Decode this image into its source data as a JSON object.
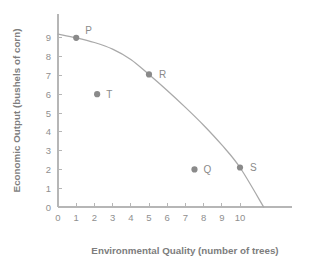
{
  "chart_data": {
    "type": "scatter",
    "title": "",
    "xlabel": "Environmental Quality (number of trees)",
    "ylabel": "Economic Output (bushels of corn)",
    "xlim": [
      0,
      11.6
    ],
    "ylim": [
      0,
      9.6
    ],
    "xticks": [
      "0",
      "1",
      "2",
      "3",
      "4",
      "5",
      "6",
      "7",
      "8",
      "9",
      "10"
    ],
    "yticks": [
      "0",
      "1",
      "2",
      "3",
      "4",
      "5",
      "6",
      "7",
      "8",
      "9"
    ],
    "grid": false,
    "legend": "none",
    "series": [
      {
        "name": "Production Possibilities Frontier",
        "type": "line",
        "x": [
          0,
          1,
          2,
          3,
          4,
          5,
          6,
          7,
          8,
          9,
          10,
          11.3
        ],
        "y": [
          9.2,
          9.0,
          8.75,
          8.4,
          7.85,
          7.05,
          6.2,
          5.3,
          4.35,
          3.3,
          2.1,
          0
        ]
      },
      {
        "name": "Labeled Points",
        "type": "scatter",
        "points": [
          {
            "label": "P",
            "x": 1.0,
            "y": 9.0,
            "label_dx": 9,
            "label_dy": -4
          },
          {
            "label": "T",
            "x": 2.15,
            "y": 6.0,
            "label_dx": 9,
            "label_dy": 4
          },
          {
            "label": "R",
            "x": 5.0,
            "y": 7.05,
            "label_dx": 10,
            "label_dy": 4
          },
          {
            "label": "Q",
            "x": 7.5,
            "y": 2.0,
            "label_dx": 9,
            "label_dy": 4
          },
          {
            "label": "S",
            "x": 10.0,
            "y": 2.1,
            "label_dx": 10,
            "label_dy": 3
          }
        ]
      }
    ]
  },
  "colors": {
    "axis": "#b6b6b6",
    "curve": "#a9a9a9",
    "point": "#8a8a8a",
    "tick_text": "#8f8f8f",
    "title_text": "#7d7d7d",
    "background": "#ffffff"
  }
}
